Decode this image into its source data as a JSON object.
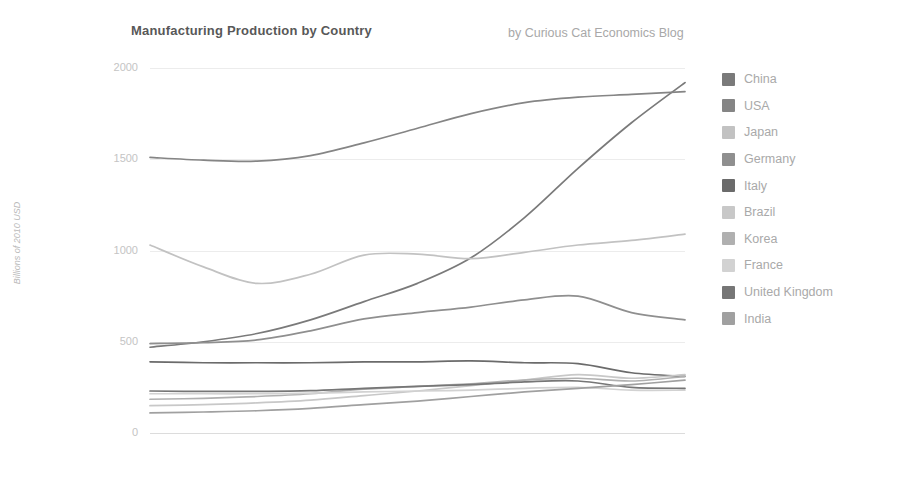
{
  "chart_data": {
    "type": "line",
    "title": "Manufacturing Production by Country",
    "subtitle": "by Curious Cat Economics Blog",
    "xlabel": "",
    "ylabel": "Billions of 2010 USD",
    "xlim": [
      2000,
      2010
    ],
    "ylim": [
      0,
      2000
    ],
    "xticks": [
      "2000",
      "2002",
      "2004",
      "2006",
      "2008",
      "2010"
    ],
    "yticks": [
      "0",
      "500",
      "1000",
      "1500",
      "2000"
    ],
    "grid": true,
    "legend_position": "right",
    "x": [
      2000,
      2001,
      2002,
      2003,
      2004,
      2005,
      2006,
      2007,
      2008,
      2009,
      2010
    ],
    "series": [
      {
        "name": "China",
        "color": "#7a7a7a",
        "values": [
          470,
          500,
          545,
          620,
          720,
          820,
          960,
          1180,
          1450,
          1700,
          1920
        ]
      },
      {
        "name": "USA",
        "color": "#858585",
        "values": [
          1510,
          1495,
          1490,
          1520,
          1590,
          1670,
          1750,
          1810,
          1840,
          1855,
          1870
        ]
      },
      {
        "name": "Japan",
        "color": "#c2c2c2",
        "values": [
          1030,
          910,
          820,
          870,
          975,
          980,
          955,
          990,
          1030,
          1055,
          1090
        ]
      },
      {
        "name": "Germany",
        "color": "#8f8f8f",
        "values": [
          490,
          495,
          510,
          560,
          625,
          660,
          690,
          730,
          750,
          660,
          620
        ]
      },
      {
        "name": "Italy",
        "color": "#6b6b6b",
        "values": [
          390,
          385,
          385,
          385,
          390,
          390,
          395,
          385,
          380,
          330,
          310
        ]
      },
      {
        "name": "Brazil",
        "color": "#c8c8c8",
        "values": [
          150,
          155,
          165,
          180,
          205,
          230,
          260,
          290,
          320,
          300,
          320
        ]
      },
      {
        "name": "Korea",
        "color": "#b0b0b0",
        "values": [
          185,
          190,
          200,
          215,
          240,
          255,
          270,
          290,
          300,
          285,
          310
        ]
      },
      {
        "name": "France",
        "color": "#d2d2d2",
        "values": [
          215,
          215,
          215,
          218,
          225,
          230,
          235,
          245,
          250,
          235,
          235
        ]
      },
      {
        "name": "United Kingdom",
        "color": "#767676",
        "values": [
          230,
          228,
          228,
          232,
          245,
          255,
          265,
          280,
          285,
          250,
          245
        ]
      },
      {
        "name": "India",
        "color": "#a0a0a0",
        "values": [
          110,
          115,
          122,
          135,
          155,
          175,
          200,
          225,
          245,
          265,
          290
        ]
      }
    ]
  },
  "legend": {
    "items": [
      {
        "label": "China"
      },
      {
        "label": "USA"
      },
      {
        "label": "Japan"
      },
      {
        "label": "Germany"
      },
      {
        "label": "Italy"
      },
      {
        "label": "Brazil"
      },
      {
        "label": "Korea"
      },
      {
        "label": "France"
      },
      {
        "label": "United Kingdom"
      },
      {
        "label": "India"
      }
    ]
  }
}
